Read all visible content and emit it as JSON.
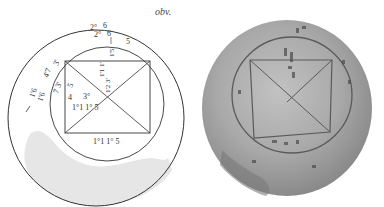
{
  "figure": {
    "side_label": "obv.",
    "drawing": {
      "outer_circle": {
        "cx": 96,
        "cy": 118,
        "r": 88
      },
      "inner_circle": {
        "cx": 107,
        "cy": 104,
        "r": 57
      },
      "rectangle": {
        "x1": 65,
        "y1": 61,
        "x2": 150,
        "y2": 133
      },
      "shaded_region_color": "#e6e6e6",
      "line_color": "#333333",
      "labels": [
        {
          "id": "top-outer-1",
          "text": "2° 6",
          "x": 92,
          "y": 29
        },
        {
          "id": "top-outer-2",
          "text": "2° 6",
          "x": 96,
          "y": 36
        },
        {
          "id": "top-inner-1",
          "text": "1 5",
          "x": 112,
          "y": 44
        },
        {
          "id": "top-inner-2",
          "text": "1'5",
          "x": 115,
          "y": 54
        },
        {
          "id": "center-vertical",
          "text": "1'1 1'5",
          "x": 102,
          "y": 64
        },
        {
          "id": "left-outer-1",
          "text": "1'6 4'7 3'",
          "x": 36,
          "y": 80
        },
        {
          "id": "left-outer-2",
          "text": "1'6",
          "x": 40,
          "y": 94
        },
        {
          "id": "left-inner",
          "text": "7 3' 5",
          "x": 60,
          "y": 86
        },
        {
          "id": "left-mid",
          "text": "4 3'",
          "x": 70,
          "y": 96
        },
        {
          "id": "inside-lower",
          "text": "1'1 1'5",
          "x": 72,
          "y": 108
        },
        {
          "id": "bottom",
          "text": "1'1 1'5",
          "x": 93,
          "y": 145
        },
        {
          "id": "tick-left",
          "text": "/",
          "x": 24,
          "y": 108
        }
      ]
    },
    "photo": {
      "description": "Photograph of round clay tablet with inscribed square and diagonals",
      "base_color": "#a8a8a8"
    }
  }
}
